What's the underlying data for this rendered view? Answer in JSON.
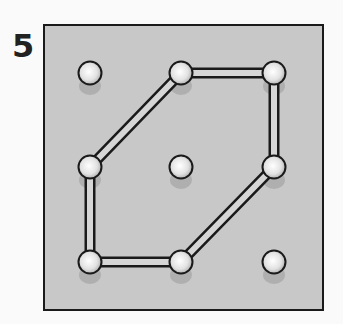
{
  "puzzle": {
    "number": "5",
    "board": {
      "x": 44,
      "y": 25,
      "w": 279,
      "h": 285,
      "fill": "#c8c8c8",
      "stroke": "#1a1a1a"
    },
    "pegs": [
      {
        "col": 0,
        "row": 0
      },
      {
        "col": 1,
        "row": 0
      },
      {
        "col": 2,
        "row": 0
      },
      {
        "col": 0,
        "row": 1
      },
      {
        "col": 1,
        "row": 1
      },
      {
        "col": 2,
        "row": 1
      },
      {
        "col": 0,
        "row": 2
      },
      {
        "col": 1,
        "row": 2
      },
      {
        "col": 2,
        "row": 2
      }
    ],
    "columns_x": [
      90,
      181,
      274
    ],
    "rows_y": [
      73,
      167,
      262
    ],
    "band_path": [
      [
        1,
        0
      ],
      [
        2,
        0
      ],
      [
        2,
        1
      ],
      [
        1,
        2
      ],
      [
        0,
        2
      ],
      [
        0,
        1
      ],
      [
        1,
        0
      ]
    ]
  }
}
